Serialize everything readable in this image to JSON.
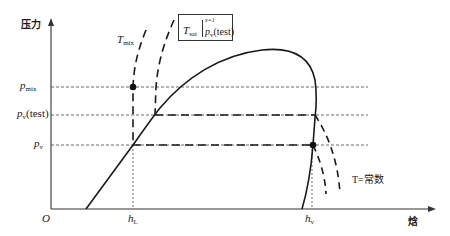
{
  "diagram": {
    "type": "pressure-enthalpy diagram",
    "axes": {
      "y_label": "压力",
      "x_label": "焓",
      "origin_label": "O"
    },
    "pressure_levels": [
      {
        "symbol": "p",
        "subscript": "mix",
        "suffix": "",
        "y": 87
      },
      {
        "symbol": "p",
        "subscript": "v",
        "suffix": "(test)",
        "y": 115
      },
      {
        "symbol": "p",
        "subscript": "v",
        "suffix": "",
        "y": 145
      }
    ],
    "enthalpy_marks": [
      {
        "symbol": "h",
        "subscript": "L",
        "x": 133
      },
      {
        "symbol": "h",
        "subscript": "v",
        "x": 312
      }
    ],
    "isotherm_labels": {
      "t_mix": {
        "symbol": "T",
        "subscript": "mix"
      },
      "t_const": "T=常数"
    },
    "saturation_box": {
      "symbol": "T",
      "subscript": "sat",
      "superscript": "x=1",
      "evaluated_at_symbol": "p",
      "evaluated_at_subscript": "v",
      "evaluated_at_suffix": "(test)"
    },
    "points": [
      {
        "name": "mix-state",
        "x": 133,
        "y": 87
      },
      {
        "name": "vapor-state",
        "x": 313,
        "y": 145
      }
    ],
    "colors": {
      "line": "#1a1a1a",
      "axis": "#333333",
      "background": "#ffffff"
    }
  }
}
